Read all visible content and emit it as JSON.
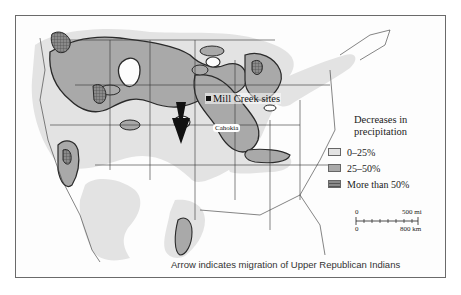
{
  "map": {
    "region": "United States (contiguous)",
    "sites": [
      {
        "label": "Mill Creek sites",
        "marker": "filled-square"
      },
      {
        "label": "Cahokia",
        "marker": "dot"
      }
    ],
    "arrow": {
      "meaning": "migration of Upper Republican Indians",
      "color": "#111111"
    }
  },
  "legend": {
    "title": "Decreases in precipitation",
    "items": [
      {
        "label": "0–25%",
        "color": "#e3e3e3",
        "pattern": "light-stipple"
      },
      {
        "label": "25–50%",
        "color": "#a9a9a9",
        "pattern": "medium-stipple"
      },
      {
        "label": "More than 50%",
        "color": "#6e6e6e",
        "pattern": "crosshatch"
      }
    ]
  },
  "scale": {
    "top_zero": "0",
    "top_max": "500 mi",
    "bottom_zero": "0",
    "bottom_max": "800 km"
  },
  "caption": "Arrow indicates migration of Upper Republican Indians",
  "colors": {
    "light": "#e3e3e3",
    "medium": "#a9a9a9",
    "dark": "#6e6e6e",
    "outline": "#2a2a2a",
    "frame": "#6a6a6a"
  }
}
